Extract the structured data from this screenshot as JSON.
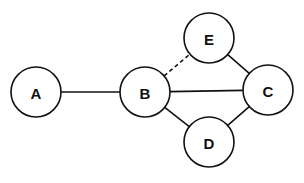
{
  "diagram": {
    "type": "graph",
    "nodes": [
      {
        "id": "A",
        "label": "A",
        "cx": 36,
        "cy": 92,
        "r": 25
      },
      {
        "id": "B",
        "label": "B",
        "cx": 145,
        "cy": 92,
        "r": 25
      },
      {
        "id": "C",
        "label": "C",
        "cx": 268,
        "cy": 90,
        "r": 25
      },
      {
        "id": "D",
        "label": "D",
        "cx": 209,
        "cy": 142,
        "r": 25
      },
      {
        "id": "E",
        "label": "E",
        "cx": 209,
        "cy": 38,
        "r": 25
      }
    ],
    "edges": [
      {
        "from": "A",
        "to": "B",
        "style": "solid"
      },
      {
        "from": "B",
        "to": "C",
        "style": "solid"
      },
      {
        "from": "B",
        "to": "D",
        "style": "solid"
      },
      {
        "from": "D",
        "to": "C",
        "style": "solid"
      },
      {
        "from": "E",
        "to": "C",
        "style": "solid"
      },
      {
        "from": "B",
        "to": "E",
        "style": "dashed"
      }
    ],
    "colors": {
      "stroke": "#111111",
      "fill": "#ffffff"
    }
  }
}
